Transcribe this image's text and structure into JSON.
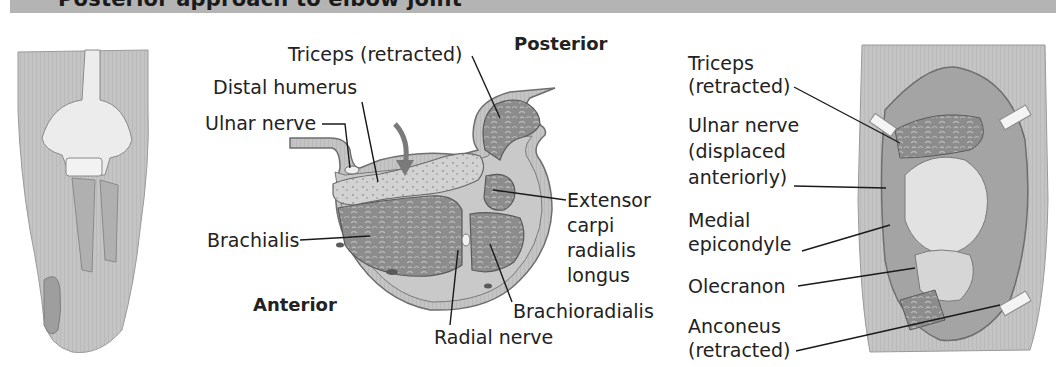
{
  "header": {
    "title": "Posterior approach to elbow joint"
  },
  "left_panel": {
    "description": "Posterior view illustration of elbow joint bones (humerus, olecranon, forearm bones)"
  },
  "center_panel": {
    "orientation_labels": {
      "posterior": "Posterior",
      "anterior": "Anterior"
    },
    "labels": {
      "triceps": "Triceps (retracted)",
      "distal_humerus": "Distal humerus",
      "ulnar_nerve": "Ulnar nerve",
      "brachialis": "Brachialis",
      "extensor": [
        "Extensor",
        "carpi",
        "radialis",
        "longus"
      ],
      "brachioradialis": "Brachioradialis",
      "radial_nerve": "Radial nerve"
    }
  },
  "right_panel": {
    "labels": {
      "triceps": [
        "Triceps",
        "(retracted)"
      ],
      "ulnar_nerve": [
        "Ulnar nerve",
        "(displaced",
        "anteriorly)"
      ],
      "medial_epicondyle": [
        "Medial",
        "epicondyle"
      ],
      "olecranon": "Olecranon",
      "anconeus": [
        "Anconeus",
        "(retracted)"
      ]
    }
  },
  "colors": {
    "header_bg": "#b4b4b4",
    "muscle": "#8a8a8a",
    "muscle_dark": "#6a6a6a",
    "fascia": "#c8c8c8",
    "bone": "#d8d8d8",
    "skin": "#bdbdbd",
    "arrow": "#7a7a7a",
    "leader": "#1a1a1a"
  }
}
